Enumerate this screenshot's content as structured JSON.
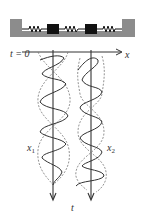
{
  "diagram": {
    "labels": {
      "t0": "t = 0",
      "x_axis": "x",
      "t_axis": "t",
      "x1": "x",
      "x1_sub": "1",
      "x2": "x",
      "x2_sub": "2"
    },
    "components": {
      "walls": 2,
      "masses": 2,
      "springs": 3
    },
    "colors": {
      "container": "#8c8c8c",
      "mass": "#111111",
      "line": "#333333",
      "dashed": "#777777"
    }
  }
}
